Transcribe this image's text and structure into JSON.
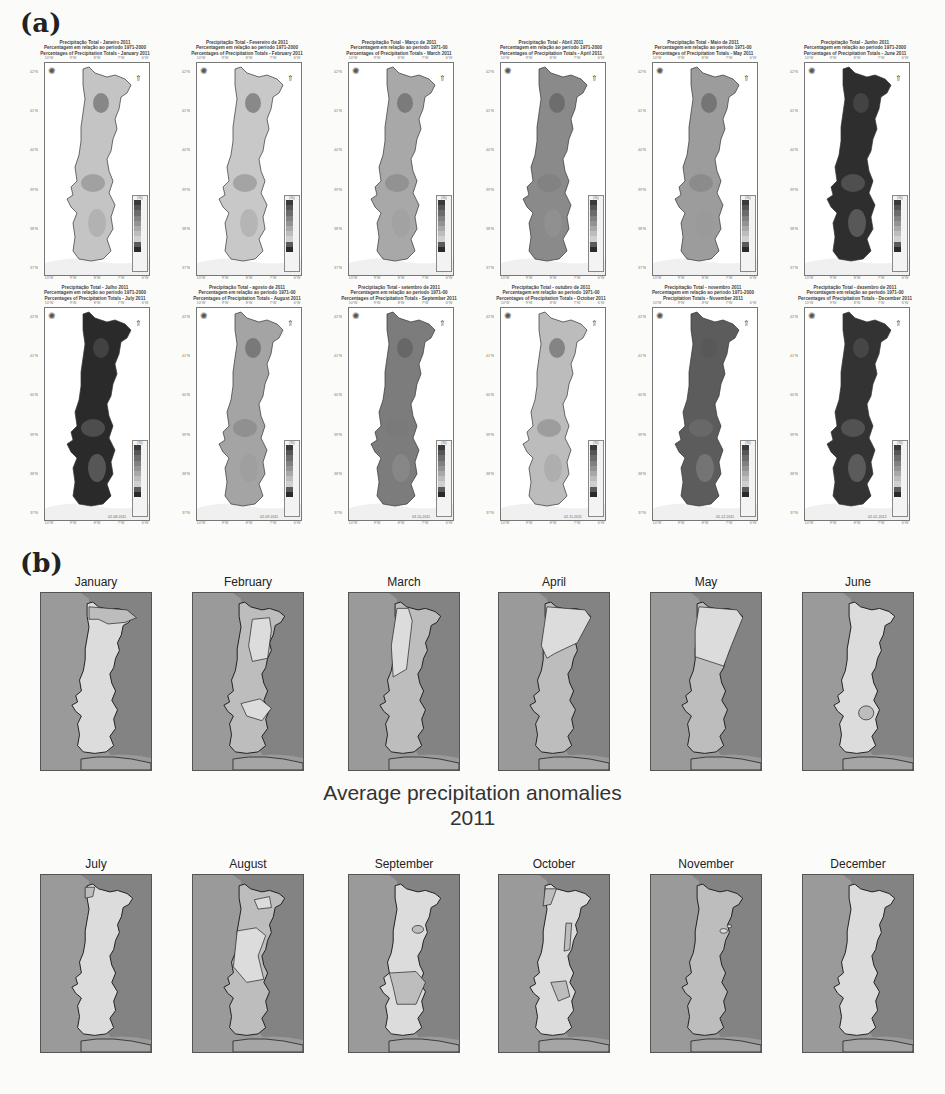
{
  "figure": {
    "panel_a_label": "(a)",
    "panel_b_label": "(b)",
    "center_title_line1": "Average precipitation anomalies",
    "center_title_line2": "2011"
  },
  "panel_a": {
    "lon_ticks": [
      "10°W",
      "9°W",
      "8°W",
      "7°W",
      "6°W"
    ],
    "lat_ticks": [
      "42°N",
      "41°N",
      "40°N",
      "39°N",
      "38°N",
      "37°N"
    ],
    "legend_unit": "(%)",
    "legend_values": [
      "400",
      "300",
      "250",
      "200",
      "150",
      "125",
      "100",
      "75",
      "50",
      "25"
    ],
    "legend_colors": [
      "#3a3a3a",
      "#555555",
      "#6b6b6b",
      "#808080",
      "#939393",
      "#a8a8a8",
      "#bdbdbd",
      "#cfcfcf",
      "#5a5a5a",
      "#2a2a2a"
    ],
    "maps": [
      {
        "line1": "Precipitação Total - Janeiro 2011",
        "line2": "Percentagem em relação ao período 1971-2000",
        "line3": "Percentages of Precipitation Totals - January 2011",
        "date": "",
        "tone": "#c4c4c4"
      },
      {
        "line1": "Precipitação Total - Fevereiro de 2011",
        "line2": "Percentagem em relação ao período 1971-2000",
        "line3": "Percentages of Precipitation Totals - February 2011",
        "date": "",
        "tone": "#c8c8c8"
      },
      {
        "line1": "Precipitação Total - Março de 2011",
        "line2": "Percentagem em relação ao período 1971-00",
        "line3": "Percentages of Precipitation Totals - March 2011",
        "date": "",
        "tone": "#a8a8a8"
      },
      {
        "line1": "Precipitação Total - Abril 2011",
        "line2": "Percentagem em relação ao período 1971-2000",
        "line3": "Percentages of Precipitation Totals - April 2011",
        "date": "",
        "tone": "#8a8a8a"
      },
      {
        "line1": "Precipitação Total - Maio de 2011",
        "line2": "Percentagem em relação ao período 1971-00",
        "line3": "Percentages of Precipitation Totals - May 2011",
        "date": "",
        "tone": "#9c9c9c"
      },
      {
        "line1": "Precipitação Total - Junho 2011",
        "line2": "Percentagem em relação ao período 1971-2000",
        "line3": "Percentages of Precipitation Totals - June 2011",
        "date": "",
        "tone": "#2e2e2e"
      },
      {
        "line1": "Precipitação Total - Julho 2011",
        "line2": "Percentagem em relação ao período 1971-2000",
        "line3": "Percentages of Precipitation Totals - July 2011",
        "date": "02-08-2011",
        "tone": "#2a2a2a"
      },
      {
        "line1": "Precipitação Total - agosto de 2011",
        "line2": "Percentagem em relação ao período 1971-00",
        "line3": "Percentages of Precipitation Totals - August 2011",
        "date": "02-09-2011",
        "tone": "#a4a4a4"
      },
      {
        "line1": "Precipitação Total - setembro de 2011",
        "line2": "Percentagem em relação ao período 1971-00",
        "line3": "Percentages of Precipitation Totals - September 2011",
        "date": "03-10-2011",
        "tone": "#7c7c7c"
      },
      {
        "line1": "Precipitação Total - outubro de 2011",
        "line2": "Percentagem em relação ao período 1971-00",
        "line3": "Percentages of Precipitation Totals - October 2011",
        "date": "02-11-2011",
        "tone": "#bcbcbc"
      },
      {
        "line1": "Precipitação Total - novembro 2011",
        "line2": "Percentagem em relação ao período 1971-2000",
        "line3": "Precipitation Totals - November 2011",
        "date": "05-12-2011",
        "tone": "#5c5c5c"
      },
      {
        "line1": "Precipitação Total - dezembro de 2011",
        "line2": "Percentagem em relação ao período 1971-00",
        "line3": "Percentages of Precipitation Totals - December 2011",
        "date": "02-01-2012",
        "tone": "#333333"
      }
    ]
  },
  "panel_b": {
    "colors": {
      "sea": "#9a9a9a",
      "spain": "#838383",
      "wet": "#bdbdbd",
      "dry": "#dcdcdc",
      "outline": "#222222"
    },
    "maps": [
      {
        "month": "January"
      },
      {
        "month": "February"
      },
      {
        "month": "March"
      },
      {
        "month": "April"
      },
      {
        "month": "May"
      },
      {
        "month": "June"
      },
      {
        "month": "July"
      },
      {
        "month": "August"
      },
      {
        "month": "September"
      },
      {
        "month": "October"
      },
      {
        "month": "November"
      },
      {
        "month": "December"
      }
    ]
  }
}
